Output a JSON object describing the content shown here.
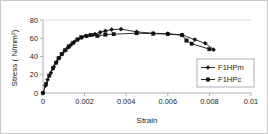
{
  "chart_data": {
    "type": "line",
    "title": "",
    "xlabel": "Strain",
    "ylabel": "Stress ( N/mm 2 )",
    "ylabel_main": "Stress ( N/mm",
    "ylabel_sup": "2",
    "ylabel_tail": ")",
    "xlim": [
      0,
      0.01
    ],
    "ylim": [
      0,
      80
    ],
    "xticks": [
      0,
      0.002,
      0.004,
      0.006,
      0.008,
      0.01
    ],
    "xticklabels": [
      "0",
      "0.002",
      "0.004",
      "0.006",
      "0.008",
      "0.01"
    ],
    "yticks": [
      0,
      20,
      40,
      60,
      80
    ],
    "yticklabels": [
      "0",
      "20",
      "40",
      "60",
      "80"
    ],
    "grid": "horizontal-top-only",
    "legend_position": "lower-right-inside",
    "series": [
      {
        "name": "F1HPm",
        "marker": "diamond",
        "color": "#111111",
        "points": [
          [
            0.0,
            0.0
          ],
          [
            0.00012,
            8.0
          ],
          [
            0.00022,
            14.5
          ],
          [
            0.00038,
            22.0
          ],
          [
            0.00052,
            28.5
          ],
          [
            0.00065,
            34.0
          ],
          [
            0.00078,
            38.5
          ],
          [
            0.00092,
            43.0
          ],
          [
            0.00105,
            46.5
          ],
          [
            0.0012,
            50.0
          ],
          [
            0.00135,
            53.0
          ],
          [
            0.0015,
            56.0
          ],
          [
            0.00168,
            59.0
          ],
          [
            0.00185,
            61.0
          ],
          [
            0.00205,
            62.5
          ],
          [
            0.00225,
            63.5
          ],
          [
            0.0025,
            64.5
          ],
          [
            0.00275,
            66.5
          ],
          [
            0.003,
            68.0
          ],
          [
            0.0033,
            69.5
          ],
          [
            0.00375,
            70.0
          ],
          [
            0.0045,
            67.0
          ],
          [
            0.0053,
            65.5
          ],
          [
            0.006,
            65.0
          ],
          [
            0.0067,
            63.5
          ],
          [
            0.0073,
            58.5
          ],
          [
            0.0078,
            54.5
          ],
          [
            0.0082,
            47.5
          ]
        ]
      },
      {
        "name": "F1HPc",
        "marker": "square",
        "color": "#111111",
        "points": [
          [
            0.0,
            0.0
          ],
          [
            0.00015,
            10.0
          ],
          [
            0.0003,
            19.0
          ],
          [
            0.00048,
            27.0
          ],
          [
            0.00062,
            33.0
          ],
          [
            0.00075,
            38.0
          ],
          [
            0.0009,
            42.5
          ],
          [
            0.00108,
            47.0
          ],
          [
            0.00125,
            51.0
          ],
          [
            0.00145,
            55.0
          ],
          [
            0.00165,
            58.5
          ],
          [
            0.00185,
            61.0
          ],
          [
            0.0021,
            62.5
          ],
          [
            0.00235,
            63.5
          ],
          [
            0.00262,
            62.5
          ],
          [
            0.003,
            64.0
          ],
          [
            0.0034,
            64.5
          ],
          [
            0.0045,
            65.5
          ],
          [
            0.0053,
            65.0
          ],
          [
            0.006,
            64.5
          ],
          [
            0.00668,
            63.5
          ],
          [
            0.0069,
            57.5
          ],
          [
            0.00715,
            54.0
          ],
          [
            0.008,
            48.0
          ]
        ]
      }
    ],
    "legend": [
      {
        "label": "F1HPm",
        "marker": "diamond"
      },
      {
        "label": "F1HPc",
        "marker": "square"
      }
    ]
  }
}
